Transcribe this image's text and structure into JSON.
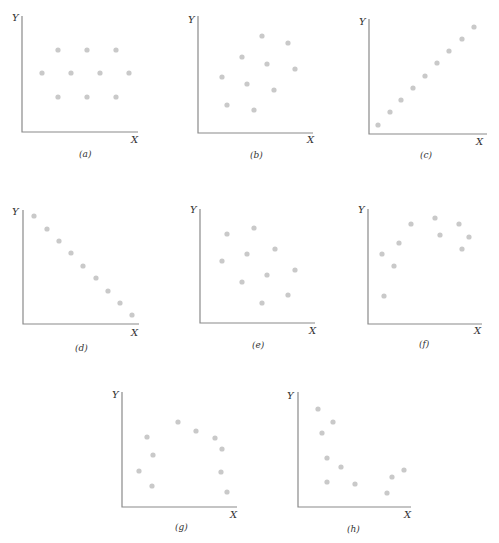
{
  "chart_data": [
    {
      "type": "scatter",
      "caption": "(a)",
      "xlabel": "X",
      "ylabel": "Y",
      "axis": {
        "ox": 22,
        "oy": 132,
        "top": 16,
        "right": 138
      },
      "ylabel_pos": [
        12,
        21
      ],
      "xlabel_pos": [
        131,
        143
      ],
      "caption_pos": [
        79,
        157
      ],
      "points": [
        [
          58,
          50
        ],
        [
          87,
          50
        ],
        [
          116,
          50
        ],
        [
          42,
          73
        ],
        [
          71,
          73
        ],
        [
          100,
          73
        ],
        [
          129,
          73
        ],
        [
          58,
          97
        ],
        [
          87,
          97
        ],
        [
          116,
          97
        ]
      ]
    },
    {
      "type": "scatter",
      "caption": "(b)",
      "xlabel": "X",
      "ylabel": "Y",
      "axis": {
        "ox": 198,
        "oy": 133,
        "top": 16,
        "right": 313
      },
      "ylabel_pos": [
        188,
        23
      ],
      "xlabel_pos": [
        307,
        143
      ],
      "caption_pos": [
        250,
        158
      ],
      "points": [
        [
          262,
          36
        ],
        [
          288,
          43
        ],
        [
          242,
          57
        ],
        [
          267,
          64
        ],
        [
          295,
          69
        ],
        [
          222,
          77
        ],
        [
          247,
          84
        ],
        [
          274,
          90
        ],
        [
          227,
          105
        ],
        [
          254,
          110
        ]
      ]
    },
    {
      "type": "scatter",
      "caption": "(c)",
      "xlabel": "X",
      "ylabel": "Y",
      "axis": {
        "ox": 369,
        "oy": 134,
        "top": 19,
        "right": 487
      },
      "ylabel_pos": [
        359,
        25
      ],
      "xlabel_pos": [
        476,
        145
      ],
      "caption_pos": [
        420,
        158
      ],
      "points": [
        [
          378,
          125
        ],
        [
          390,
          112
        ],
        [
          401,
          100
        ],
        [
          413,
          88
        ],
        [
          425,
          76
        ],
        [
          437,
          63
        ],
        [
          449,
          51
        ],
        [
          462,
          39
        ],
        [
          474,
          27
        ]
      ]
    },
    {
      "type": "scatter",
      "caption": "(d)",
      "xlabel": "X",
      "ylabel": "Y",
      "axis": {
        "ox": 23,
        "oy": 324,
        "top": 210,
        "right": 139
      },
      "ylabel_pos": [
        12,
        215
      ],
      "xlabel_pos": [
        131,
        336
      ],
      "caption_pos": [
        75,
        351
      ],
      "points": [
        [
          34,
          216
        ],
        [
          47,
          229
        ],
        [
          59,
          241
        ],
        [
          71,
          253
        ],
        [
          83,
          266
        ],
        [
          96,
          278
        ],
        [
          108,
          291
        ],
        [
          120,
          303
        ],
        [
          132,
          315
        ]
      ]
    },
    {
      "type": "scatter",
      "caption": "(e)",
      "xlabel": "X",
      "ylabel": "Y",
      "axis": {
        "ox": 200,
        "oy": 323,
        "top": 209,
        "right": 315
      },
      "ylabel_pos": [
        190,
        213
      ],
      "xlabel_pos": [
        309,
        334
      ],
      "caption_pos": [
        252,
        348
      ],
      "points": [
        [
          227,
          234
        ],
        [
          254,
          228
        ],
        [
          275,
          249
        ],
        [
          247,
          254
        ],
        [
          222,
          261
        ],
        [
          267,
          275
        ],
        [
          295,
          270
        ],
        [
          242,
          282
        ],
        [
          288,
          295
        ],
        [
          262,
          303
        ]
      ]
    },
    {
      "type": "scatter",
      "caption": "(f)",
      "xlabel": "X",
      "ylabel": "Y",
      "axis": {
        "ox": 368,
        "oy": 324,
        "top": 209,
        "right": 482
      },
      "ylabel_pos": [
        358,
        213
      ],
      "xlabel_pos": [
        474,
        334
      ],
      "caption_pos": [
        419,
        347
      ],
      "points": [
        [
          435,
          218
        ],
        [
          411,
          224
        ],
        [
          459,
          224
        ],
        [
          440,
          235
        ],
        [
          469,
          237
        ],
        [
          399,
          243
        ],
        [
          382,
          254
        ],
        [
          462,
          249
        ],
        [
          394,
          266
        ],
        [
          384,
          296
        ]
      ]
    },
    {
      "type": "scatter",
      "caption": "(g)",
      "xlabel": "X",
      "ylabel": "Y",
      "axis": {
        "ox": 122,
        "oy": 507,
        "top": 392,
        "right": 237
      },
      "ylabel_pos": [
        112,
        398
      ],
      "xlabel_pos": [
        230,
        518
      ],
      "caption_pos": [
        175,
        530
      ],
      "points": [
        [
          178,
          422
        ],
        [
          196,
          431
        ],
        [
          215,
          438
        ],
        [
          147,
          437
        ],
        [
          222,
          449
        ],
        [
          153,
          455
        ],
        [
          139,
          471
        ],
        [
          221,
          472
        ],
        [
          152,
          486
        ],
        [
          227,
          492
        ]
      ]
    },
    {
      "type": "scatter",
      "caption": "(h)",
      "xlabel": "X",
      "ylabel": "Y",
      "axis": {
        "ox": 298,
        "oy": 507,
        "top": 392,
        "right": 411
      },
      "ylabel_pos": [
        287,
        399
      ],
      "xlabel_pos": [
        404,
        518
      ],
      "caption_pos": [
        347,
        532
      ],
      "points": [
        [
          318,
          409
        ],
        [
          333,
          422
        ],
        [
          322,
          433
        ],
        [
          327,
          458
        ],
        [
          341,
          467
        ],
        [
          327,
          482
        ],
        [
          355,
          484
        ],
        [
          387,
          493
        ],
        [
          392,
          477
        ],
        [
          404,
          470
        ]
      ]
    }
  ],
  "colors": {
    "dot": "#c9c9c9",
    "axis": "#8a8a8a",
    "text": "#333333"
  }
}
